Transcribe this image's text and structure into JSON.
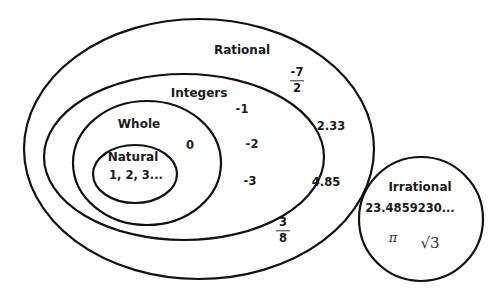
{
  "sets": {
    "rational": {
      "label": "Rational",
      "members": {
        "frac1": {
          "num": "-7",
          "den": "2"
        },
        "d1": "2.33",
        "d2": "4.85",
        "frac2": {
          "num": "3",
          "den": "8"
        }
      }
    },
    "integers": {
      "label": "Integers",
      "members": [
        "-1",
        "-2",
        "-3"
      ]
    },
    "whole": {
      "label": "Whole",
      "members": [
        "0"
      ]
    },
    "natural": {
      "label": "Natural",
      "members_text": "1, 2, 3..."
    },
    "irrational": {
      "label": "Irrational",
      "members": {
        "decimal": "23.4859230...",
        "pi": "π",
        "sqrt3": "√3"
      }
    }
  },
  "colors": {
    "stroke": "#111111",
    "text": "#1a1a1a",
    "background": "#ffffff"
  }
}
